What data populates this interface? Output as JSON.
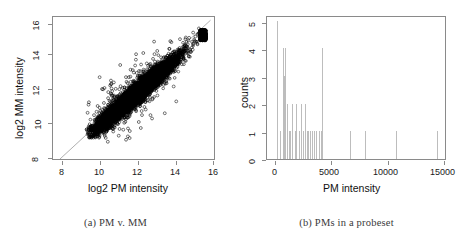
{
  "figure": {
    "panels": [
      {
        "id": "pm-vs-mm",
        "caption": "(a) PM v. MM"
      },
      {
        "id": "pms-in-probeset",
        "caption": "(b) PMs in a probeset"
      }
    ]
  },
  "colors": {
    "axis": "#8a8a8a",
    "point": "#000000",
    "diagonal": "#9a9a9a",
    "bar": "#bdbdbd",
    "text": "#1a1a1a",
    "caption": "#3a3a3a",
    "background": "#ffffff"
  },
  "chart_data": [
    {
      "type": "scatter",
      "id": "pm-vs-mm",
      "title": "",
      "xlabel": "log2 PM intensity",
      "ylabel": "log2 MM intensity",
      "xlim": [
        7.2,
        16.4
      ],
      "ylim": [
        7.6,
        16.4
      ],
      "xticks": [
        8,
        10,
        12,
        14,
        16
      ],
      "xticklabels": [
        "8",
        "10",
        "12",
        "14",
        "16"
      ],
      "yticks": [
        8,
        10,
        12,
        14,
        16
      ],
      "yticklabels": [
        "8",
        "10",
        "12",
        "14",
        "16"
      ],
      "grid": false,
      "legend": null,
      "point_style": "open-circle",
      "n_points_approx": 16000,
      "annotations": [
        {
          "kind": "reference-line",
          "label": "y = x identity line",
          "from": [
            7.6,
            7.6
          ],
          "to": [
            16.2,
            16.2
          ],
          "color": "#9a9a9a"
        }
      ],
      "cloud_description": {
        "orientation": "positive-diagonal",
        "x_range": [
          9.1,
          15.8
        ],
        "y_range": [
          9.2,
          15.6
        ],
        "core_x_mean": 11.9,
        "core_y_mean": 11.6,
        "slope": 0.93,
        "x_sd": 1.15,
        "residual_sd": 0.32,
        "saturation_x": 15.6,
        "saturation_y": 15.3,
        "note": "dense elongated cloud, MM slightly below PM, saturation cluster at top-right"
      }
    },
    {
      "type": "bar",
      "id": "pms-in-probeset",
      "title": "",
      "xlabel": "PM intensity",
      "ylabel": "counts",
      "xlim": [
        0,
        15900
      ],
      "ylim": [
        0,
        5.2
      ],
      "xticks": [
        0,
        5000,
        10000,
        15000
      ],
      "xticklabels": [
        "0",
        "5000",
        "10000",
        "15000"
      ],
      "yticks": [
        0,
        1,
        2,
        3,
        4,
        5
      ],
      "yticklabels": [
        "0",
        "1",
        "2",
        "3",
        "4",
        "5"
      ],
      "grid": false,
      "legend": null,
      "bar_style": "thin-spike",
      "categories": [
        900,
        1150,
        1400,
        1500,
        1620,
        1750,
        1900,
        2050,
        2250,
        2450,
        2600,
        2800,
        3000,
        3200,
        3350,
        3500,
        3650,
        3800,
        3950,
        4150,
        4350,
        4550,
        4750,
        4900,
        7300,
        8700,
        11400,
        15000
      ],
      "values": [
        5,
        1,
        4,
        3,
        4,
        2,
        1,
        1,
        2,
        1,
        2,
        1,
        2,
        1,
        2,
        1,
        1,
        1,
        1,
        1,
        1,
        1,
        1,
        4,
        1,
        1,
        1,
        1
      ]
    }
  ]
}
